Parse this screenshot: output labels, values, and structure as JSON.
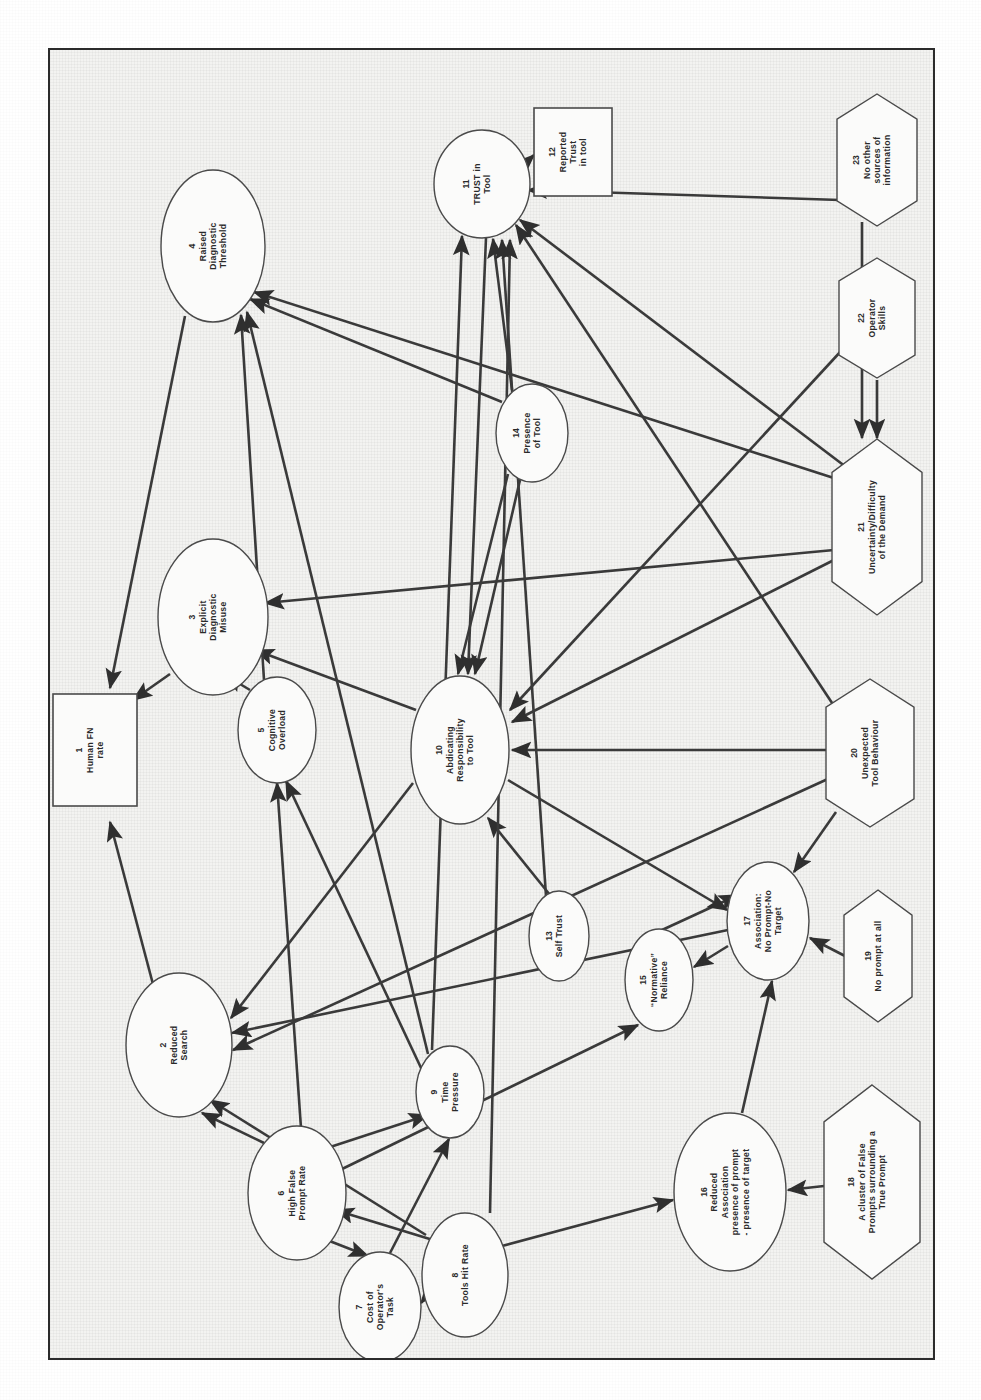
{
  "page": {
    "orientation": "rotated-90-clockwise",
    "frame_color": "#2b2b2b",
    "paper_color": "#f3f3f1",
    "ink_color": "#3a3a3a",
    "top_margin_artifact": ""
  },
  "legend": {
    "shape_meanings": [
      {
        "shape": "ellipse",
        "meaning": "process / state variable"
      },
      {
        "shape": "rectangle",
        "meaning": "measured outcome"
      },
      {
        "shape": "hexagon",
        "meaning": "external / situational factor"
      }
    ]
  },
  "nodes": [
    {
      "id": "1",
      "num": "1",
      "label": "Human FN rate",
      "lines": [
        "Human FN",
        "rate"
      ],
      "shape": "rect",
      "cx": 45,
      "cy": 700,
      "rx": 42,
      "ry": 56
    },
    {
      "id": "2",
      "num": "2",
      "label": "Reduced Search",
      "lines": [
        "Reduced",
        "Search"
      ],
      "shape": "ellipse",
      "cx": 129,
      "cy": 995,
      "rx": 53,
      "ry": 72
    },
    {
      "id": "3",
      "num": "3",
      "label": "Explicit Diagnostic Misuse",
      "lines": [
        "Explicit",
        "Diagnostic",
        "Misuse"
      ],
      "shape": "ellipse",
      "cx": 163,
      "cy": 567,
      "rx": 55,
      "ry": 78
    },
    {
      "id": "4",
      "num": "4",
      "label": "Raised Diagnostic Threshold",
      "lines": [
        "Raised",
        "Diagnostic",
        "Threshold"
      ],
      "shape": "ellipse",
      "cx": 163,
      "cy": 196,
      "rx": 52,
      "ry": 76
    },
    {
      "id": "5",
      "num": "5",
      "label": "Cognitive Overload",
      "lines": [
        "Cognitive",
        "Overload"
      ],
      "shape": "ellipse",
      "cx": 227,
      "cy": 680,
      "rx": 39,
      "ry": 53
    },
    {
      "id": "6",
      "num": "6",
      "label": "High False Prompt Rate",
      "lines": [
        "High False",
        "Prompt Rate"
      ],
      "shape": "ellipse",
      "cx": 247,
      "cy": 1143,
      "rx": 49,
      "ry": 67
    },
    {
      "id": "7",
      "num": "7",
      "label": "Cost of Operator's Task",
      "lines": [
        "Cost of",
        "Operator's",
        "Task"
      ],
      "shape": "ellipse",
      "cx": 330,
      "cy": 1257,
      "rx": 41,
      "ry": 55
    },
    {
      "id": "8",
      "num": "8",
      "label": "Tools Hit Rate",
      "lines": [
        "Tools Hit Rate"
      ],
      "shape": "ellipse",
      "cx": 415,
      "cy": 1225,
      "rx": 43,
      "ry": 62
    },
    {
      "id": "9",
      "num": "9",
      "label": "Time Pressure",
      "lines": [
        "Time",
        "Pressure"
      ],
      "shape": "ellipse",
      "cx": 400,
      "cy": 1042,
      "rx": 34,
      "ry": 46
    },
    {
      "id": "10",
      "num": "10",
      "label": "Abdicating Responsibility to Tool",
      "lines": [
        "Abdicating",
        "Responsibility",
        "to Tool"
      ],
      "shape": "ellipse",
      "cx": 410,
      "cy": 700,
      "rx": 49,
      "ry": 74
    },
    {
      "id": "11",
      "num": "11",
      "label": "TRUST in Tool",
      "lines": [
        "TRUST in",
        "Tool"
      ],
      "shape": "ellipse",
      "cx": 432,
      "cy": 134,
      "rx": 48,
      "ry": 54
    },
    {
      "id": "12",
      "num": "12",
      "label": "Reported Trust in tool",
      "lines": [
        "Reported",
        "Trust",
        "in tool"
      ],
      "shape": "rect",
      "cx": 523,
      "cy": 102,
      "rx": 39,
      "ry": 44
    },
    {
      "id": "13",
      "num": "13",
      "label": "Self Trust",
      "lines": [
        "Self Trust"
      ],
      "shape": "ellipse",
      "cx": 509,
      "cy": 886,
      "rx": 30,
      "ry": 45
    },
    {
      "id": "14",
      "num": "14",
      "label": "Presence of Tool",
      "lines": [
        "Presence",
        "of Tool"
      ],
      "shape": "ellipse",
      "cx": 482,
      "cy": 383,
      "rx": 36,
      "ry": 49
    },
    {
      "id": "15",
      "num": "15",
      "label": "“Normative” Reliance",
      "lines": [
        "“Normative”",
        "Reliance"
      ],
      "shape": "ellipse",
      "cx": 609,
      "cy": 930,
      "rx": 34,
      "ry": 51
    },
    {
      "id": "16",
      "num": "16",
      "label": "Reduced Association presence of prompt - presence of target",
      "lines": [
        "Reduced",
        "Association",
        "presence of prompt",
        "- presence of target"
      ],
      "shape": "ellipse",
      "cx": 680,
      "cy": 1142,
      "rx": 56,
      "ry": 79
    },
    {
      "id": "17",
      "num": "17",
      "label": "Association: No Prompt-No Target",
      "lines": [
        "Association:",
        "No Prompt-No",
        "Target"
      ],
      "shape": "ellipse",
      "cx": 718,
      "cy": 871,
      "rx": 41,
      "ry": 59
    },
    {
      "id": "18",
      "num": "18",
      "label": "A cluster of False Prompts surrounding a True Prompt",
      "lines": [
        "A cluster of False",
        "Prompts surrounding a",
        "True Prompt"
      ],
      "shape": "hexagon",
      "cx": 822,
      "cy": 1132,
      "rx": 48,
      "ry": 97
    },
    {
      "id": "19",
      "num": "19",
      "label": "No prompt at all",
      "lines": [
        "No prompt at all"
      ],
      "shape": "hexagon",
      "cx": 828,
      "cy": 906,
      "rx": 34,
      "ry": 66
    },
    {
      "id": "20",
      "num": "20",
      "label": "Unexpected Tool Behaviour",
      "lines": [
        "Unexpected",
        "Tool Behaviour"
      ],
      "shape": "hexagon",
      "cx": 820,
      "cy": 703,
      "rx": 44,
      "ry": 74
    },
    {
      "id": "21",
      "num": "21",
      "label": "Uncertainty/Difficulty of the Demand",
      "lines": [
        "Uncertainty/Difficulty",
        "of the Demand"
      ],
      "shape": "hexagon",
      "cx": 827,
      "cy": 477,
      "rx": 45,
      "ry": 88
    },
    {
      "id": "22",
      "num": "22",
      "label": "Operator Skills",
      "lines": [
        "Operator",
        "Skills"
      ],
      "shape": "hexagon",
      "cx": 827,
      "cy": 268,
      "rx": 38,
      "ry": 60
    },
    {
      "id": "23",
      "num": "23",
      "label": "No other sources of information",
      "lines": [
        "No other",
        "sources of",
        "information"
      ],
      "shape": "hexagon",
      "cx": 827,
      "cy": 110,
      "rx": 40,
      "ry": 66
    }
  ],
  "edges": [
    {
      "from": "2",
      "to": "1",
      "x1": 104,
      "y1": 938,
      "x2": 60,
      "y2": 772
    },
    {
      "from": "4",
      "to": "1",
      "x1": 135,
      "y1": 266,
      "x2": 60,
      "y2": 638
    },
    {
      "from": "3",
      "to": "1",
      "x1": 120,
      "y1": 624,
      "x2": 83,
      "y2": 650
    },
    {
      "from": "5",
      "to": "3",
      "x1": 200,
      "y1": 640,
      "x2": 175,
      "y2": 625
    },
    {
      "from": "10",
      "to": "3",
      "x1": 366,
      "y1": 660,
      "x2": 205,
      "y2": 600
    },
    {
      "from": "21",
      "to": "3",
      "x1": 784,
      "y1": 500,
      "x2": 215,
      "y2": 553
    },
    {
      "from": "14",
      "to": "4",
      "x1": 452,
      "y1": 352,
      "x2": 200,
      "y2": 249
    },
    {
      "from": "9",
      "to": "4",
      "x1": 378,
      "y1": 1004,
      "x2": 197,
      "y2": 262
    },
    {
      "from": "5",
      "to": "4",
      "x1": 214,
      "y1": 630,
      "x2": 191,
      "y2": 265
    },
    {
      "from": "21",
      "to": "4",
      "x1": 790,
      "y1": 430,
      "x2": 204,
      "y2": 242
    },
    {
      "from": "9",
      "to": "5",
      "x1": 372,
      "y1": 1020,
      "x2": 236,
      "y2": 731
    },
    {
      "from": "6",
      "to": "5",
      "x1": 251,
      "y1": 1078,
      "x2": 227,
      "y2": 733
    },
    {
      "from": "6",
      "to": "2",
      "x1": 214,
      "y1": 1093,
      "x2": 152,
      "y2": 1063
    },
    {
      "from": "8",
      "to": "2",
      "x1": 376,
      "y1": 1185,
      "x2": 160,
      "y2": 1050
    },
    {
      "from": "10",
      "to": "2",
      "x1": 363,
      "y1": 733,
      "x2": 181,
      "y2": 968
    },
    {
      "from": "17",
      "to": "2",
      "x1": 678,
      "y1": 880,
      "x2": 182,
      "y2": 983
    },
    {
      "from": "20",
      "to": "2",
      "x1": 780,
      "y1": 728,
      "x2": 183,
      "y2": 1000
    },
    {
      "from": "6",
      "to": "9",
      "x1": 271,
      "y1": 1100,
      "x2": 378,
      "y2": 1065
    },
    {
      "from": "7",
      "to": "9",
      "x1": 340,
      "y1": 1203,
      "x2": 399,
      "y2": 1089
    },
    {
      "from": "6",
      "to": "7",
      "x1": 277,
      "y1": 1190,
      "x2": 318,
      "y2": 1206
    },
    {
      "from": "8",
      "to": "7",
      "x1": 375,
      "y1": 1248,
      "x2": 371,
      "y2": 1253
    },
    {
      "from": "8",
      "to": "6",
      "x1": 383,
      "y1": 1190,
      "x2": 285,
      "y2": 1160
    },
    {
      "from": "8",
      "to": "16",
      "x1": 452,
      "y1": 1196,
      "x2": 623,
      "y2": 1150
    },
    {
      "from": "18",
      "to": "16",
      "x1": 774,
      "y1": 1136,
      "x2": 738,
      "y2": 1140
    },
    {
      "from": "16",
      "to": "17",
      "x1": 692,
      "y1": 1063,
      "x2": 722,
      "y2": 931
    },
    {
      "from": "19",
      "to": "17",
      "x1": 795,
      "y1": 906,
      "x2": 760,
      "y2": 888
    },
    {
      "from": "20",
      "to": "17",
      "x1": 786,
      "y1": 762,
      "x2": 744,
      "y2": 822
    },
    {
      "from": "17",
      "to": "15",
      "x1": 678,
      "y1": 896,
      "x2": 644,
      "y2": 917
    },
    {
      "from": "15",
      "to": "17",
      "x1": 612,
      "y1": 880,
      "x2": 688,
      "y2": 845
    },
    {
      "from": "6",
      "to": "15",
      "x1": 290,
      "y1": 1120,
      "x2": 588,
      "y2": 975
    },
    {
      "from": "10",
      "to": "17",
      "x1": 458,
      "y1": 730,
      "x2": 677,
      "y2": 860
    },
    {
      "from": "13",
      "to": "10",
      "x1": 500,
      "y1": 845,
      "x2": 438,
      "y2": 768
    },
    {
      "from": "14",
      "to": "10",
      "x1": 470,
      "y1": 430,
      "x2": 425,
      "y2": 624
    },
    {
      "from": "14",
      "to": "10",
      "x1": 458,
      "y1": 424,
      "x2": 408,
      "y2": 624
    },
    {
      "from": "21",
      "to": "10",
      "x1": 784,
      "y1": 510,
      "x2": 462,
      "y2": 672
    },
    {
      "from": "20",
      "to": "10",
      "x1": 778,
      "y1": 700,
      "x2": 462,
      "y2": 700
    },
    {
      "from": "22",
      "to": "10",
      "x1": 792,
      "y1": 300,
      "x2": 460,
      "y2": 660
    },
    {
      "from": "11",
      "to": "10",
      "x1": 436,
      "y1": 188,
      "x2": 418,
      "y2": 624
    },
    {
      "from": "11",
      "to": "12",
      "x1": 470,
      "y1": 118,
      "x2": 484,
      "y2": 105
    },
    {
      "from": "14",
      "to": "11",
      "x1": 462,
      "y1": 340,
      "x2": 443,
      "y2": 189
    },
    {
      "from": "9",
      "to": "11",
      "x1": 382,
      "y1": 1000,
      "x2": 412,
      "y2": 186
    },
    {
      "from": "13",
      "to": "11",
      "x1": 496,
      "y1": 846,
      "x2": 452,
      "y2": 190
    },
    {
      "from": "23",
      "to": "11",
      "x1": 790,
      "y1": 150,
      "x2": 478,
      "y2": 140
    },
    {
      "from": "20",
      "to": "11",
      "x1": 790,
      "y1": 665,
      "x2": 466,
      "y2": 175
    },
    {
      "from": "21",
      "to": "11",
      "x1": 800,
      "y1": 420,
      "x2": 470,
      "y2": 170
    },
    {
      "from": "8",
      "to": "11",
      "x1": 440,
      "y1": 1163,
      "x2": 460,
      "y2": 190
    },
    {
      "from": "22",
      "to": "21",
      "x1": 827,
      "y1": 330,
      "x2": 827,
      "y2": 388
    },
    {
      "from": "23",
      "to": "21",
      "x1": 812,
      "y1": 172,
      "x2": 812,
      "y2": 388
    }
  ]
}
